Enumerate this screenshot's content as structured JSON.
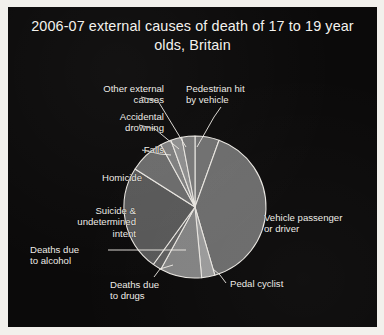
{
  "figure": {
    "background_color": "#0b0a0a",
    "page_color": "#f2f0ec",
    "text_color": "#efece7"
  },
  "title": "2006-07 external causes of death of 17 to 19 year olds, Britain",
  "chart_data": {
    "type": "pie",
    "title": "2006-07 external causes of death of 17 to 19 year olds, Britain",
    "xlabel": "",
    "ylabel": "",
    "legend_position": "none",
    "grid": false,
    "start_angle_deg": 0,
    "direction": "clockwise",
    "labels": [
      "Pedestrian hit by vehicle",
      "Vehicle passenger or driver",
      "Pedal cyclist",
      "Deaths due to drugs",
      "Deaths due to alcohol",
      "Suicide & undetermined intent",
      "Homicide",
      "Falls",
      "Accidental drowning",
      "Other external causes"
    ],
    "values": [
      5.5,
      40.0,
      3.0,
      9.5,
      2.0,
      24.0,
      8.0,
      2.5,
      2.5,
      3.0
    ],
    "unit": "percent",
    "colors": [
      "#6f6f6f",
      "#6b6b6b",
      "#9a9a9a",
      "#828282",
      "#5e5e5e",
      "#575757",
      "#6a6a6a",
      "#7e7e7e",
      "#8d8d8d",
      "#777777"
    ],
    "slice_edge_color": "#e9e6e1"
  },
  "labels": {
    "other_external_causes": "Other external\ncauses",
    "accidental_drowning": "Accidental\ndrowning",
    "falls": "Falls",
    "homicide": "Homicide",
    "suicide_undetermined_intent": "Suicide &\nundetermined\nintent",
    "deaths_due_to_alcohol": "Deaths due\nto alcohol",
    "deaths_due_to_drugs": "Deaths due\nto drugs",
    "pedal_cyclist": "Pedal cyclist",
    "vehicle_passenger_or_driver": "Vehicle passenger\nor driver",
    "pedestrian_hit_by_vehicle": "Pedestrian hit\nby vehicle"
  }
}
